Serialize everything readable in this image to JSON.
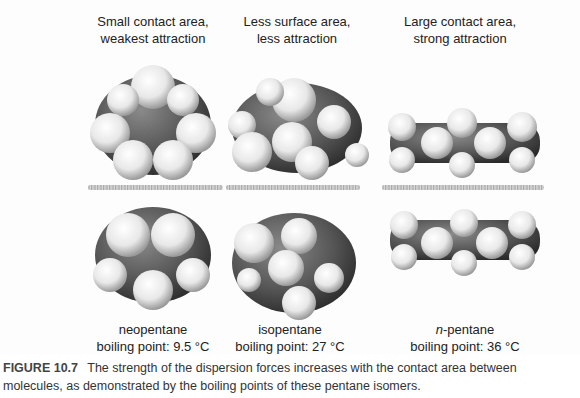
{
  "figure": {
    "columns": [
      {
        "heading_line1": "Small contact area,",
        "heading_line2": "weakest attraction",
        "molecule": "neopentane",
        "molecule_prefix": "",
        "boiling_point": "boiling point: 9.5 °C"
      },
      {
        "heading_line1": "Less surface area,",
        "heading_line2": "less attraction",
        "molecule": "isopentane",
        "molecule_prefix": "",
        "boiling_point": "boiling point: 27 °C"
      },
      {
        "heading_line1": "Large contact area,",
        "heading_line2": "strong attraction",
        "molecule": "-pentane",
        "molecule_prefix": "n",
        "boiling_point": "boiling point: 36 °C"
      }
    ]
  },
  "caption": {
    "label": "FIGURE 10.7",
    "text": "The strength of the dispersion forces increases with the contact area between molecules, as demonstrated by the boiling points of these pentane isomers."
  },
  "colors": {
    "carbon": "#5a5a5a",
    "hydrogen": "#f2f2f2",
    "text": "#222222"
  }
}
